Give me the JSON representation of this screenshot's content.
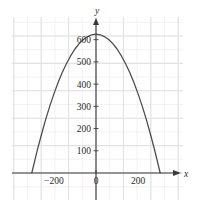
{
  "chart_data": {
    "type": "line",
    "title": "",
    "subtitle": "",
    "xlabel": "x",
    "ylabel": "y",
    "grid": true,
    "legend": null,
    "xlim": [
      -380,
      410
    ],
    "ylim": [
      -110,
      720
    ],
    "x_ticks": [
      -200,
      0,
      200
    ],
    "x_tick_labels": [
      "−200",
      "0",
      "200"
    ],
    "y_ticks": [
      100,
      200,
      300,
      400,
      500,
      600
    ],
    "y_tick_labels": [
      "100",
      "200",
      "300",
      "400",
      "500",
      "600"
    ],
    "curve_color": "#4a4a4a",
    "grid_color": "#ececec",
    "axis_color": "#3a3a3a",
    "background_color": "#ffffff",
    "series": [
      {
        "name": "parabola",
        "type": "line",
        "description": "downward-opening parabola",
        "vertex": [
          0,
          625
        ],
        "roots": [
          -305,
          305
        ],
        "x": [
          -305,
          -280,
          -260,
          -240,
          -220,
          -200,
          -180,
          -160,
          -140,
          -120,
          -100,
          -80,
          -60,
          -40,
          -20,
          0,
          20,
          40,
          60,
          80,
          100,
          120,
          140,
          160,
          180,
          200,
          220,
          240,
          260,
          280,
          305
        ],
        "values": [
          0,
          98,
          170,
          238,
          300,
          356,
          407,
          453,
          493,
          528,
          558,
          582,
          601,
          614,
          622,
          625,
          622,
          614,
          601,
          582,
          558,
          528,
          493,
          453,
          407,
          356,
          300,
          238,
          170,
          98,
          0
        ]
      }
    ],
    "axis_labels": {
      "x_axis_name": "x",
      "y_axis_name": "y"
    }
  },
  "geometry": {
    "plot_left": 12,
    "plot_right": 183,
    "plot_top": 17,
    "plot_bottom": 200,
    "origin_x": 96,
    "origin_y": 173,
    "px_per_x_unit": 0.2105,
    "px_per_y_unit": 0.2222,
    "grid_step_px": 13.7
  }
}
